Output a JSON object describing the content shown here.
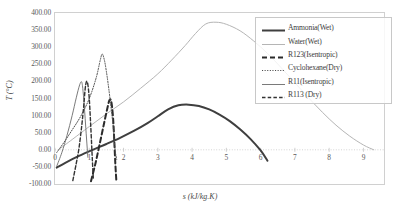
{
  "chart_data": {
    "type": "line",
    "title": "",
    "xlabel": "s (kJ/kg.K)",
    "ylabel": "T (°C)",
    "xlim": [
      0,
      9.6
    ],
    "ylim": [
      -100,
      400
    ],
    "xticks": [
      "0",
      "1",
      "2",
      "3",
      "4",
      "5",
      "6",
      "7",
      "8",
      "9"
    ],
    "yticks": [
      "400.00",
      "350.00",
      "300.00",
      "250.00",
      "200.00",
      "150.00",
      "100.00",
      "50.00",
      "0.00",
      "-50.00",
      "-100.00"
    ],
    "grid": "zero-line-only",
    "legend_position": "top-right-inside",
    "series": [
      {
        "name": "Ammonia(Wet)",
        "style": "solid-thick",
        "color": "#3f3f3f",
        "points": [
          [
            0.05,
            -52
          ],
          [
            0.3,
            -38
          ],
          [
            0.7,
            -18
          ],
          [
            1.1,
            0
          ],
          [
            1.5,
            17
          ],
          [
            1.9,
            35
          ],
          [
            2.3,
            55
          ],
          [
            2.7,
            78
          ],
          [
            3.0,
            98
          ],
          [
            3.3,
            118
          ],
          [
            3.6,
            130
          ],
          [
            3.9,
            132
          ],
          [
            4.2,
            128
          ],
          [
            4.5,
            118
          ],
          [
            4.8,
            103
          ],
          [
            5.1,
            84
          ],
          [
            5.4,
            60
          ],
          [
            5.7,
            32
          ],
          [
            6.0,
            -2
          ],
          [
            6.2,
            -32
          ]
        ]
      },
      {
        "name": "Water(Wet)",
        "style": "solid-thin-light",
        "color": "#b5b5b5",
        "points": [
          [
            0.1,
            0
          ],
          [
            0.5,
            30
          ],
          [
            1.0,
            68
          ],
          [
            1.5,
            105
          ],
          [
            2.0,
            140
          ],
          [
            2.5,
            180
          ],
          [
            3.0,
            222
          ],
          [
            3.4,
            262
          ],
          [
            3.8,
            305
          ],
          [
            4.1,
            340
          ],
          [
            4.4,
            368
          ],
          [
            4.7,
            373
          ],
          [
            5.0,
            367
          ],
          [
            5.4,
            348
          ],
          [
            5.8,
            318
          ],
          [
            6.2,
            282
          ],
          [
            6.6,
            240
          ],
          [
            7.0,
            196
          ],
          [
            7.4,
            152
          ],
          [
            7.8,
            110
          ],
          [
            8.2,
            72
          ],
          [
            8.6,
            40
          ],
          [
            9.0,
            14
          ],
          [
            9.3,
            0
          ]
        ]
      },
      {
        "name": "R123(Isentropic)",
        "style": "dashed-thick",
        "color": "#2b2b2b",
        "points": [
          [
            1.05,
            -92
          ],
          [
            1.18,
            -40
          ],
          [
            1.3,
            15
          ],
          [
            1.42,
            72
          ],
          [
            1.52,
            118
          ],
          [
            1.58,
            143
          ],
          [
            1.62,
            147
          ],
          [
            1.66,
            130
          ],
          [
            1.7,
            85
          ],
          [
            1.73,
            25
          ],
          [
            1.76,
            -40
          ],
          [
            1.79,
            -90
          ]
        ]
      },
      {
        "name": "Cyclohexane(Dry)",
        "style": "dotted-thin",
        "color": "#4d4d4d",
        "points": [
          [
            0.05,
            -8
          ],
          [
            0.25,
            20
          ],
          [
            0.5,
            58
          ],
          [
            0.75,
            98
          ],
          [
            1.0,
            150
          ],
          [
            1.2,
            210
          ],
          [
            1.32,
            262
          ],
          [
            1.38,
            280
          ],
          [
            1.45,
            258
          ],
          [
            1.52,
            215
          ],
          [
            1.58,
            170
          ],
          [
            1.63,
            128
          ],
          [
            1.68,
            85
          ],
          [
            1.72,
            42
          ],
          [
            1.76,
            -5
          ],
          [
            1.8,
            -28
          ]
        ]
      },
      {
        "name": "R11(Isentropic)",
        "style": "solid-thin-dark",
        "color": "#6b6b6b",
        "points": [
          [
            0.05,
            -48
          ],
          [
            0.2,
            -8
          ],
          [
            0.35,
            42
          ],
          [
            0.5,
            100
          ],
          [
            0.62,
            152
          ],
          [
            0.72,
            190
          ],
          [
            0.78,
            198
          ],
          [
            0.82,
            170
          ],
          [
            0.86,
            120
          ],
          [
            0.9,
            62
          ],
          [
            0.94,
            5
          ],
          [
            0.96,
            -22
          ]
        ]
      },
      {
        "name": "R113 (Dry)",
        "style": "dashed-thin",
        "color": "#333333",
        "points": [
          [
            0.52,
            -90
          ],
          [
            0.62,
            -40
          ],
          [
            0.7,
            5
          ],
          [
            0.78,
            70
          ],
          [
            0.84,
            130
          ],
          [
            0.88,
            178
          ],
          [
            0.92,
            200
          ],
          [
            0.96,
            190
          ],
          [
            1.0,
            150
          ],
          [
            1.03,
            95
          ],
          [
            1.06,
            35
          ],
          [
            1.09,
            -30
          ],
          [
            1.12,
            -88
          ]
        ]
      }
    ]
  },
  "axes": {
    "y_tick_labels": [
      "400.00",
      "350.00",
      "300.00",
      "250.00",
      "200.00",
      "150.00",
      "100.00",
      "50.00",
      "0.00",
      "-50.00",
      "-100.00"
    ],
    "x_tick_labels": [
      "0",
      "1",
      "2",
      "3",
      "4",
      "5",
      "6",
      "7",
      "8",
      "9"
    ],
    "x_axis_title": "s (kJ/kg.K)",
    "y_axis_title": "T (°C)"
  },
  "legend": {
    "items": [
      {
        "label": "Ammonia(Wet)",
        "swatch": "solid-thick",
        "color": "#3f3f3f"
      },
      {
        "label": "Water(Wet)",
        "swatch": "solid-thin-light",
        "color": "#b5b5b5"
      },
      {
        "label": "R123(Isentropic)",
        "swatch": "dashed-thick",
        "color": "#2b2b2b"
      },
      {
        "label": "Cyclohexane(Dry)",
        "swatch": "dotted-thin",
        "color": "#4d4d4d"
      },
      {
        "label": "R11(Isentropic)",
        "swatch": "solid-thin-dark",
        "color": "#6b6b6b"
      },
      {
        "label": "R113 (Dry)",
        "swatch": "dashed-thin",
        "color": "#333333"
      }
    ]
  },
  "colors": {
    "plot_border": "#d0d0d0",
    "zero_line": "#c9c9c9",
    "tick_text": "#595959",
    "axis_title": "#4a4a4a"
  }
}
